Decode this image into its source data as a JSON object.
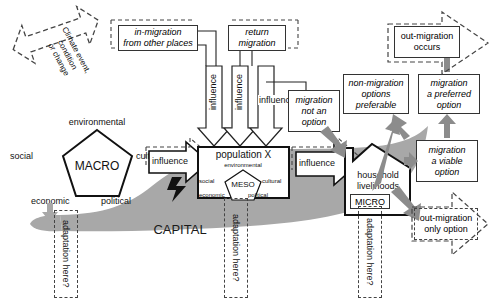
{
  "diagram": {
    "colors": {
      "gray_fill": "#a8a8a8",
      "gray_arrow": "#8c8c8c",
      "outline": "#333333",
      "dashed": "#444444",
      "background": "#ffffff"
    }
  },
  "climate": {
    "line1": "Climate event,",
    "line2": "condition",
    "line3": "or change"
  },
  "macro": {
    "center": "MACRO",
    "top": "environmental",
    "left": "social",
    "right": "cultural",
    "bottom_left": "economic",
    "bottom_right": "political"
  },
  "meso": {
    "center": "MESO",
    "top": "environmental",
    "left": "social",
    "right": "cultural",
    "bottom_left": "economic",
    "bottom_right": "political"
  },
  "micro": {
    "label": "MICRO"
  },
  "boxes": {
    "in_migration": "in-migration\nfrom other places",
    "return_migration": "return\nmigration",
    "population": "population X",
    "migration_not_option": "migration\nnot an\noption",
    "non_migration_preferable": "non-migration\noptions\npreferable",
    "migration_preferred": "migration\na preferred\noption",
    "migration_viable": "migration\na viable\noption",
    "household": "household\nlivelihoods",
    "out_migration_occurs": "out-migration\noccurs",
    "out_migration_only": "out-migration\nonly option"
  },
  "arrows": {
    "influence_1": "influence",
    "influence_2": "influence",
    "influence_3": "influence",
    "influence_macro": "influence",
    "influence_pop": "influence"
  },
  "capital": {
    "label": "CAPITAL"
  },
  "adaptation": {
    "left": "adaptation here?",
    "middle": "adaptation here?",
    "right": "adaptation here?"
  }
}
